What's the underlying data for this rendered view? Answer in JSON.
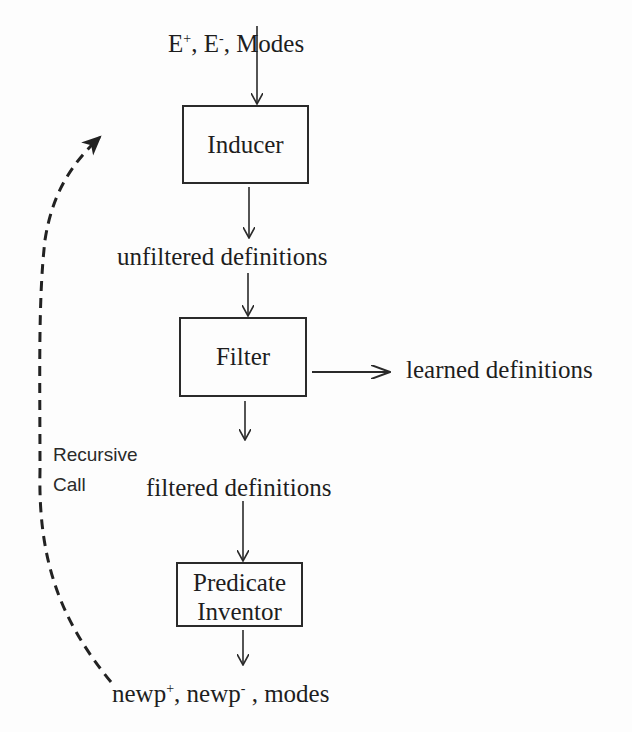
{
  "diagram": {
    "inputs": {
      "e_pos_base": "E",
      "e_pos_sup": "+",
      "e_neg_base": "E",
      "e_neg_sup": "-",
      "separator": ", ",
      "modes": "Modes"
    },
    "nodes": {
      "inducer": "Inducer",
      "filter": "Filter",
      "predicate_inventor_line1": "Predicate",
      "predicate_inventor_line2": "Inventor"
    },
    "edge_labels": {
      "unfiltered": "unfiltered definitions",
      "learned": "learned definitions",
      "filtered": "filtered definitions",
      "recursive_line1": "Recursive",
      "recursive_line2": "Call"
    },
    "outputs": {
      "newp_pos_base": "newp",
      "newp_pos_sup": "+",
      "newp_neg_base": "newp",
      "newp_neg_sup": "-",
      "separator": ", ",
      "modes_sep": " , ",
      "modes": "modes"
    },
    "edges": [
      {
        "from": "inputs",
        "to": "inducer",
        "style": "solid"
      },
      {
        "from": "inducer",
        "to": "unfiltered definitions",
        "style": "solid"
      },
      {
        "from": "unfiltered definitions",
        "to": "filter",
        "style": "solid"
      },
      {
        "from": "filter",
        "to": "learned definitions",
        "style": "solid"
      },
      {
        "from": "filter",
        "to": "filtered definitions",
        "style": "solid"
      },
      {
        "from": "filtered definitions",
        "to": "predicate inventor",
        "style": "solid"
      },
      {
        "from": "predicate inventor",
        "to": "outputs",
        "style": "solid"
      },
      {
        "from": "outputs",
        "to": "inducer",
        "style": "dashed",
        "label": "Recursive Call"
      }
    ],
    "colors": {
      "ink": "#222222",
      "background": "#fdfdfd"
    }
  }
}
